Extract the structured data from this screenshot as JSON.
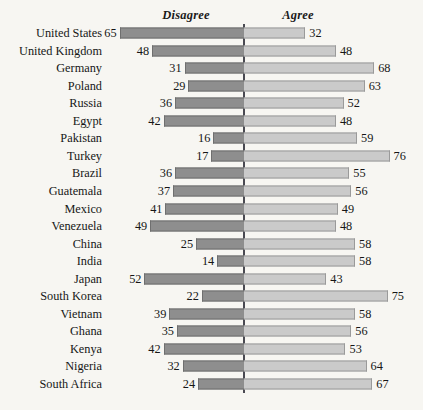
{
  "chart_data": {
    "type": "bar",
    "subtype": "diverging-horizontal-bar",
    "title": "",
    "xlabel": "",
    "ylabel": "",
    "legend_position": "top",
    "grid": false,
    "axis_center_value": 0,
    "value_unit": "percent",
    "xlim": [
      0,
      80
    ],
    "headers": {
      "left": "Disagree",
      "right": "Agree"
    },
    "series": [
      {
        "name": "Disagree",
        "side": "left",
        "color": "#8e8e8e",
        "border_color": "#6f6f6f"
      },
      {
        "name": "Agree",
        "side": "right",
        "color": "#cacaca",
        "border_color": "#9a9a9a"
      }
    ],
    "categories": [
      "United States",
      "United Kingdom",
      "Germany",
      "Poland",
      "Russia",
      "Egypt",
      "Pakistan",
      "Turkey",
      "Brazil",
      "Guatemala",
      "Mexico",
      "Venezuela",
      "China",
      "India",
      "Japan",
      "South Korea",
      "Vietnam",
      "Ghana",
      "Kenya",
      "Nigeria",
      "South Africa"
    ],
    "rows": [
      {
        "label": "United States",
        "disagree": 65,
        "agree": 32
      },
      {
        "label": "United Kingdom",
        "disagree": 48,
        "agree": 48
      },
      {
        "label": "Germany",
        "disagree": 31,
        "agree": 68
      },
      {
        "label": "Poland",
        "disagree": 29,
        "agree": 63
      },
      {
        "label": "Russia",
        "disagree": 36,
        "agree": 52
      },
      {
        "label": "Egypt",
        "disagree": 42,
        "agree": 48
      },
      {
        "label": "Pakistan",
        "disagree": 16,
        "agree": 59
      },
      {
        "label": "Turkey",
        "disagree": 17,
        "agree": 76
      },
      {
        "label": "Brazil",
        "disagree": 36,
        "agree": 55
      },
      {
        "label": "Guatemala",
        "disagree": 37,
        "agree": 56
      },
      {
        "label": "Mexico",
        "disagree": 41,
        "agree": 49
      },
      {
        "label": "Venezuela",
        "disagree": 49,
        "agree": 48
      },
      {
        "label": "China",
        "disagree": 25,
        "agree": 58
      },
      {
        "label": "India",
        "disagree": 14,
        "agree": 58
      },
      {
        "label": "Japan",
        "disagree": 52,
        "agree": 43
      },
      {
        "label": "South Korea",
        "disagree": 22,
        "agree": 75
      },
      {
        "label": "Vietnam",
        "disagree": 39,
        "agree": 58
      },
      {
        "label": "Ghana",
        "disagree": 35,
        "agree": 56
      },
      {
        "label": "Kenya",
        "disagree": 42,
        "agree": 53
      },
      {
        "label": "Nigeria",
        "disagree": 32,
        "agree": 64
      },
      {
        "label": "South Africa",
        "disagree": 24,
        "agree": 67
      }
    ]
  },
  "layout": {
    "center_x": 244,
    "px_per_unit": 1.915,
    "first_row_y": 33,
    "row_pitch": 17.55,
    "bar_height": 11,
    "head_left_x": 186,
    "head_right_x": 298,
    "head_y": 8,
    "axis_top": 24,
    "axis_bottom": 393
  },
  "colors": {
    "background": "#f7f6f2",
    "axis": "#4a4a52",
    "text": "#161616",
    "disagree_fill": "#8e8e8e",
    "agree_fill": "#cacaca"
  }
}
